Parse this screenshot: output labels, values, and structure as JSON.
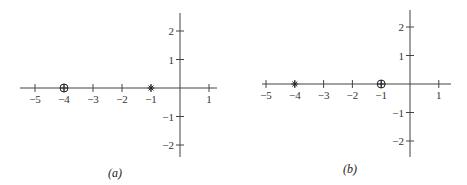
{
  "chart_data": [
    {
      "type": "scatter",
      "title": "",
      "caption": "(a)",
      "xlabel": "",
      "ylabel": "",
      "x_ticks": [
        -5,
        -4,
        -3,
        -2,
        -1,
        1
      ],
      "x_tick_labels": [
        "−5",
        "−4",
        "−3",
        "−2",
        "−1",
        "1"
      ],
      "y_ticks": [
        2,
        1,
        -1,
        -2
      ],
      "y_tick_labels": [
        "2",
        "1",
        "−1",
        "−2"
      ],
      "xlim": [
        -5.5,
        1.3
      ],
      "ylim": [
        -2.6,
        2.6
      ],
      "grid": false,
      "points": [
        {
          "x": -4,
          "y": 0,
          "marker": "circle-plus",
          "meaning": "zero"
        },
        {
          "x": -1,
          "y": 0,
          "marker": "asterisk",
          "meaning": "pole"
        }
      ]
    },
    {
      "type": "scatter",
      "title": "",
      "caption": "(b)",
      "xlabel": "",
      "ylabel": "",
      "x_ticks": [
        -5,
        -4,
        -3,
        -2,
        -1,
        1
      ],
      "x_tick_labels": [
        "−5",
        "−4",
        "−3",
        "−2",
        "−1",
        "1"
      ],
      "y_ticks": [
        2,
        1,
        -1,
        -2
      ],
      "y_tick_labels": [
        "2",
        "1",
        "−1",
        "−2"
      ],
      "xlim": [
        -5.5,
        1.3
      ],
      "ylim": [
        -2.6,
        2.6
      ],
      "grid": false,
      "points": [
        {
          "x": -4,
          "y": 0,
          "marker": "asterisk",
          "meaning": "pole"
        },
        {
          "x": -1,
          "y": 0,
          "marker": "circle-plus",
          "meaning": "zero"
        }
      ]
    }
  ],
  "panels": {
    "a": {
      "caption": "(a)"
    },
    "b": {
      "caption": "(b)"
    }
  }
}
